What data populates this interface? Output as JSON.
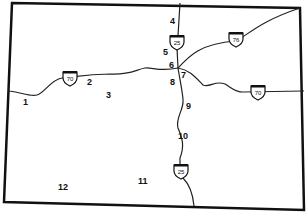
{
  "map": {
    "colors": {
      "border": "#111111",
      "road": "#222222",
      "background": "#ffffff"
    },
    "highways": [
      {
        "id": "I-70",
        "label": "70",
        "shields": [
          [
            70,
            78
          ],
          [
            258,
            92
          ]
        ]
      },
      {
        "id": "I-76",
        "label": "76",
        "shields": [
          [
            236,
            39
          ]
        ]
      },
      {
        "id": "I-25",
        "label": "25",
        "shields": [
          [
            176,
            42
          ],
          [
            181,
            171
          ]
        ]
      }
    ],
    "numbered_points": [
      {
        "label": "1",
        "x": 26,
        "y": 103
      },
      {
        "label": "2",
        "x": 89,
        "y": 83
      },
      {
        "label": "3",
        "x": 108,
        "y": 96
      },
      {
        "label": "4",
        "x": 171,
        "y": 22
      },
      {
        "label": "5",
        "x": 164,
        "y": 52
      },
      {
        "label": "6",
        "x": 170,
        "y": 65
      },
      {
        "label": "7",
        "x": 182,
        "y": 76
      },
      {
        "label": "8",
        "x": 170,
        "y": 82
      },
      {
        "label": "9",
        "x": 187,
        "y": 106
      },
      {
        "label": "10",
        "x": 178,
        "y": 137
      },
      {
        "label": "11",
        "x": 140,
        "y": 181
      },
      {
        "label": "12",
        "x": 58,
        "y": 187
      }
    ]
  }
}
